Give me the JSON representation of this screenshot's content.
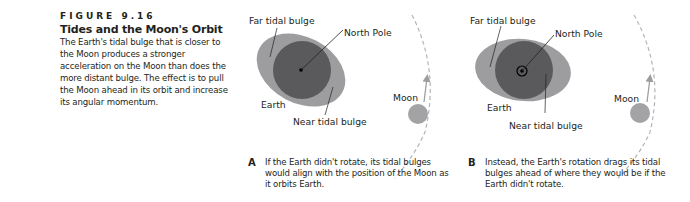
{
  "caption": {
    "figure_number": "FIGURE 9.16",
    "title": "Tides and the Moon's Orbit",
    "body": "The Earth's tidal bulge that is closer to the Moon produces a stronger acceleration on the Moon than does the more distant bulge. The effect is to pull the Moon ahead in its orbit and increase its angular momentum."
  },
  "panels": [
    {
      "id": "A",
      "labels": {
        "far_bulge": "Far tidal bulge",
        "north_pole": "North Pole",
        "earth": "Earth",
        "near_bulge": "Near tidal bulge",
        "moon": "Moon"
      },
      "text": "If the Earth didn't rotate, its tidal bulges would align with the position of the Moon as it orbits Earth."
    },
    {
      "id": "B",
      "labels": {
        "far_bulge": "Far tidal bulge",
        "north_pole": "North Pole",
        "earth": "Earth",
        "near_bulge": "Near tidal bulge",
        "moon": "Moon"
      },
      "text": "Instead, the Earth's rotation drags its tidal bulges ahead of where they would be if the Earth didn't rotate."
    }
  ],
  "colors": {
    "earth": "#5a5a5c",
    "bulge": "#9d9d9f",
    "moon": "#a3a3a5",
    "orbit": "#b5b5b7",
    "text": "#231f20"
  }
}
